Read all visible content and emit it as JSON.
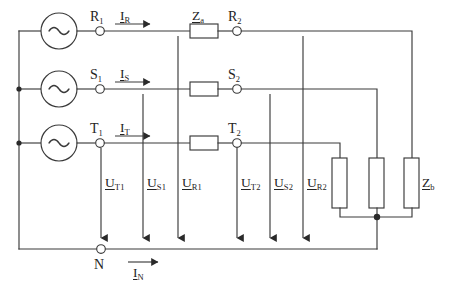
{
  "diagram": {
    "type": "electrical-schematic",
    "line_color": "#3a3a3a",
    "background": "#ffffff"
  },
  "sources": [
    {
      "id": "src-r",
      "symbol": "~",
      "terminal": {
        "base": "R",
        "sub": "1"
      }
    },
    {
      "id": "src-s",
      "symbol": "~",
      "terminal": {
        "base": "S",
        "sub": "1"
      }
    },
    {
      "id": "src-t",
      "symbol": "~",
      "terminal": {
        "base": "T",
        "sub": "1"
      }
    }
  ],
  "line_currents": [
    {
      "id": "i-r",
      "base": "I",
      "sub": "R"
    },
    {
      "id": "i-s",
      "base": "I",
      "sub": "S"
    },
    {
      "id": "i-t",
      "base": "I",
      "sub": "T"
    }
  ],
  "neutral_current": {
    "id": "i-n",
    "base": "I",
    "sub": "N"
  },
  "series_impedance": {
    "id": "z-a",
    "base": "Z",
    "sub": "a"
  },
  "load_impedance": {
    "id": "z-b",
    "base": "Z",
    "sub": "b"
  },
  "load_terminals": [
    {
      "id": "term-r2",
      "base": "R",
      "sub": "2"
    },
    {
      "id": "term-s2",
      "base": "S",
      "sub": "2"
    },
    {
      "id": "term-t2",
      "base": "T",
      "sub": "2"
    }
  ],
  "neutral_terminal": {
    "id": "term-n",
    "base": "N",
    "sub": ""
  },
  "voltages_source_side": [
    {
      "id": "u-t1",
      "base": "U",
      "sub": "T1"
    },
    {
      "id": "u-s1",
      "base": "U",
      "sub": "S1"
    },
    {
      "id": "u-r1",
      "base": "U",
      "sub": "R1"
    }
  ],
  "voltages_load_side": [
    {
      "id": "u-t2",
      "base": "U",
      "sub": "T2"
    },
    {
      "id": "u-s2",
      "base": "U",
      "sub": "S2"
    },
    {
      "id": "u-r2",
      "base": "U",
      "sub": "R2"
    }
  ]
}
